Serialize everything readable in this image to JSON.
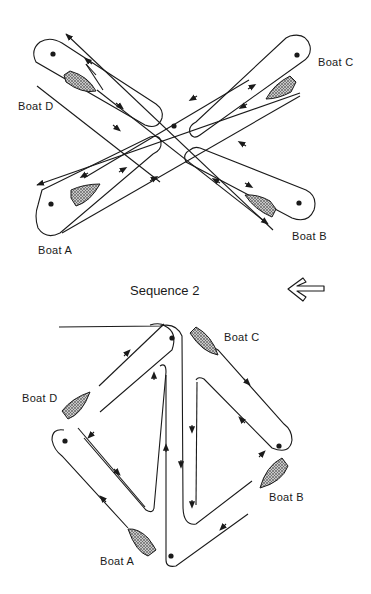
{
  "figure": {
    "sequence_1": {
      "boats": [
        {
          "id": "A",
          "label": "Boat A"
        },
        {
          "id": "B",
          "label": "Boat B"
        },
        {
          "id": "C",
          "label": "Boat C"
        },
        {
          "id": "D",
          "label": "Boat D"
        }
      ],
      "layout": "cross",
      "buoy_count": 5
    },
    "sequence_2": {
      "title": "Sequence 2",
      "boats": [
        {
          "id": "A",
          "label": "Boat A"
        },
        {
          "id": "B",
          "label": "Boat B"
        },
        {
          "id": "C",
          "label": "Boat C"
        },
        {
          "id": "D",
          "label": "Boat D"
        }
      ],
      "layout": "diamond",
      "buoy_count": 4
    },
    "transition_arrow": "left-arrow-icon",
    "colors": {
      "line": "#1a1a1a",
      "boat_fill": "#9a9a9a",
      "background": "#ffffff"
    }
  }
}
